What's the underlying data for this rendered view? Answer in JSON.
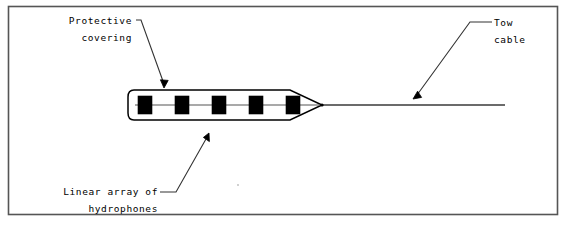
{
  "figure": {
    "kind": "towed-hydrophone-array-schematic",
    "background_color": "#ffffff",
    "line_color": "#000000",
    "border_color": "#555555"
  },
  "labels": {
    "protective_covering": {
      "line1": "Protective",
      "line2": "covering"
    },
    "tow_cable": {
      "line1": "Tow",
      "line2": "cable"
    },
    "linear_array": {
      "line1": "Linear array of",
      "line2": "hydrophones"
    }
  },
  "array": {
    "hydrophone_count": 5,
    "hydrophone_fill": "#000000",
    "body_outline_color": "#000000",
    "internal_wire_color": "#555555"
  },
  "cable": {
    "color": "#3a3a3a"
  }
}
